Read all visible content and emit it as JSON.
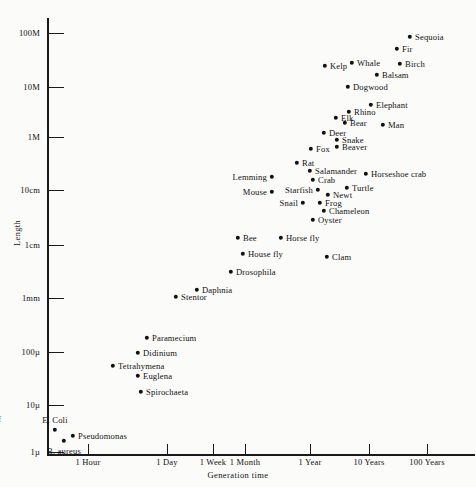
{
  "chart_data": {
    "type": "scatter",
    "title": "",
    "xlabel": "Generation time",
    "ylabel": "Length",
    "xscale": "log",
    "yscale": "log",
    "grid": false,
    "legend": false,
    "xticks": [
      "1 Hour",
      "1 Day",
      "1 Week",
      "1 Month",
      "1 Year",
      "10 Years",
      "100 Years"
    ],
    "yticks": [
      "100M",
      "10M",
      "1M",
      "10cm",
      "1cm",
      "1mm",
      "100µ",
      "10µ",
      "1µ"
    ],
    "note": "Length (log) vs generation time (log) for organisms; each point is one species/organism.",
    "points": [
      {
        "label": "Sequoia",
        "x": 410,
        "y": 37,
        "pos": "right"
      },
      {
        "label": "Fir",
        "x": 397,
        "y": 49,
        "pos": "right"
      },
      {
        "label": "Kelp",
        "x": 325,
        "y": 66,
        "pos": "right"
      },
      {
        "label": "Whale",
        "x": 352,
        "y": 63,
        "pos": "right"
      },
      {
        "label": "Birch",
        "x": 400,
        "y": 64,
        "pos": "right"
      },
      {
        "label": "Balsam",
        "x": 377,
        "y": 75,
        "pos": "right"
      },
      {
        "label": "Dogwood",
        "x": 348,
        "y": 87,
        "pos": "right"
      },
      {
        "label": "Elephant",
        "x": 371,
        "y": 105,
        "pos": "right"
      },
      {
        "label": "Rhino",
        "x": 349,
        "y": 112,
        "pos": "right"
      },
      {
        "label": "Elk",
        "x": 336,
        "y": 118,
        "pos": "right"
      },
      {
        "label": "Bear",
        "x": 345,
        "y": 123,
        "pos": "right"
      },
      {
        "label": "Man",
        "x": 383,
        "y": 125,
        "pos": "right"
      },
      {
        "label": "Deer",
        "x": 324,
        "y": 133,
        "pos": "right"
      },
      {
        "label": "Snake",
        "x": 337,
        "y": 140,
        "pos": "right"
      },
      {
        "label": "Beaver",
        "x": 337,
        "y": 147,
        "pos": "right"
      },
      {
        "label": "Fox",
        "x": 311,
        "y": 149,
        "pos": "right"
      },
      {
        "label": "Rat",
        "x": 297,
        "y": 163,
        "pos": "right"
      },
      {
        "label": "Salamander",
        "x": 310,
        "y": 171,
        "pos": "right"
      },
      {
        "label": "Horseshoe crab",
        "x": 366,
        "y": 174,
        "pos": "right"
      },
      {
        "label": "Lemming",
        "x": 272,
        "y": 177,
        "pos": "left"
      },
      {
        "label": "Crab",
        "x": 313,
        "y": 180,
        "pos": "right"
      },
      {
        "label": "Turtle",
        "x": 347,
        "y": 188,
        "pos": "right"
      },
      {
        "label": "Starfish",
        "x": 318,
        "y": 190,
        "pos": "left"
      },
      {
        "label": "Mouse",
        "x": 272,
        "y": 192,
        "pos": "left"
      },
      {
        "label": "Newt",
        "x": 328,
        "y": 195,
        "pos": "right"
      },
      {
        "label": "Frog",
        "x": 320,
        "y": 203,
        "pos": "right"
      },
      {
        "label": "Snail",
        "x": 303,
        "y": 203,
        "pos": "left"
      },
      {
        "label": "Chameleon",
        "x": 324,
        "y": 211,
        "pos": "right"
      },
      {
        "label": "Oyster",
        "x": 313,
        "y": 220,
        "pos": "right"
      },
      {
        "label": "Bee",
        "x": 238,
        "y": 238,
        "pos": "right"
      },
      {
        "label": "Horse fly",
        "x": 281,
        "y": 238,
        "pos": "right"
      },
      {
        "label": "House fly",
        "x": 243,
        "y": 254,
        "pos": "right"
      },
      {
        "label": "Clam",
        "x": 327,
        "y": 257,
        "pos": "right"
      },
      {
        "label": "Drosophila",
        "x": 231,
        "y": 272,
        "pos": "right"
      },
      {
        "label": "Daphnia",
        "x": 197,
        "y": 290,
        "pos": "right"
      },
      {
        "label": "Stentor",
        "x": 176,
        "y": 297,
        "pos": "right"
      },
      {
        "label": "Paramecium",
        "x": 147,
        "y": 338,
        "pos": "right"
      },
      {
        "label": "Didinium",
        "x": 138,
        "y": 353,
        "pos": "right"
      },
      {
        "label": "Tetrahymena",
        "x": 113,
        "y": 366,
        "pos": "right"
      },
      {
        "label": "Euglena",
        "x": 138,
        "y": 376,
        "pos": "right"
      },
      {
        "label": "Spirochaeta",
        "x": 141,
        "y": 392,
        "pos": "right"
      },
      {
        "label": "E. Coli",
        "x": 55,
        "y": 430,
        "pos": "above"
      },
      {
        "label": "Pseudomonas",
        "x": 73,
        "y": 436,
        "pos": "right"
      },
      {
        "label": "B. aureus",
        "x": 64,
        "y": 441,
        "pos": "below"
      }
    ],
    "ytick_positions": [
      {
        "label": "100M",
        "y": 33
      },
      {
        "label": "10M",
        "y": 87
      },
      {
        "label": "1M",
        "y": 137
      },
      {
        "label": "10cm",
        "y": 190
      },
      {
        "label": "1cm",
        "y": 245
      },
      {
        "label": "1mm",
        "y": 298
      },
      {
        "label": "100µ",
        "y": 352
      },
      {
        "label": "10µ",
        "y": 405
      },
      {
        "label": "1µ",
        "y": 452
      }
    ],
    "xtick_positions": [
      {
        "label": "1 Hour",
        "x": 88
      },
      {
        "label": "1 Day",
        "x": 167
      },
      {
        "label": "1 Week",
        "x": 213
      },
      {
        "label": "1 Month",
        "x": 245
      },
      {
        "label": "1 Year",
        "x": 310
      },
      {
        "label": "10 Years",
        "x": 369
      },
      {
        "label": "100 Years",
        "x": 427
      }
    ]
  },
  "fragment": {
    "left_edge_text": "of"
  }
}
